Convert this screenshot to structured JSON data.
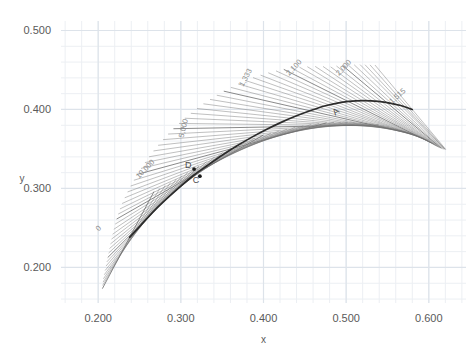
{
  "chart_data": {
    "type": "line",
    "title": "",
    "xlabel": "x",
    "ylabel": "y",
    "xlim": [
      0.155,
      0.645
    ],
    "ylim": [
      0.155,
      0.512
    ],
    "xticks": [
      "0.200",
      "0.300",
      "0.400",
      "0.500",
      "0.600"
    ],
    "xtick_values": [
      0.2,
      0.3,
      0.4,
      0.5,
      0.6
    ],
    "yticks": [
      "0.200",
      "0.300",
      "0.400",
      "0.500"
    ],
    "ytick_values": [
      0.2,
      0.3,
      0.4,
      0.5
    ],
    "grid": true,
    "grid_minor": true,
    "legend": "none",
    "series": [
      {
        "name": "trajectory",
        "type": "line",
        "color": "#2b2b2b",
        "x": [
          0.238,
          0.252,
          0.268,
          0.284,
          0.3,
          0.316,
          0.332,
          0.35,
          0.368,
          0.386,
          0.404,
          0.422,
          0.44,
          0.458,
          0.476,
          0.494,
          0.512,
          0.53,
          0.548,
          0.566,
          0.58
        ],
        "y": [
          0.238,
          0.254,
          0.272,
          0.288,
          0.303,
          0.317,
          0.329,
          0.342,
          0.354,
          0.365,
          0.375,
          0.384,
          0.392,
          0.399,
          0.405,
          0.409,
          0.411,
          0.411,
          0.409,
          0.405,
          0.4
        ]
      },
      {
        "name": "direction-field",
        "type": "segments",
        "color": "#6e6e6e",
        "description": "family of straight tangent lines crossing the trajectory"
      }
    ],
    "points": [
      {
        "label": "D",
        "x": 0.316,
        "y": 0.3245
      },
      {
        "label": "C",
        "x": 0.323,
        "y": 0.3155
      },
      {
        "label": "A",
        "x": 0.4905,
        "y": 0.4035
      }
    ],
    "contour_labels": [
      {
        "text": "0",
        "x": 0.2025,
        "y": 0.2475,
        "rotation": -46
      },
      {
        "text": "10,000",
        "x": 0.259,
        "y": 0.3225,
        "rotation": -46
      },
      {
        "text": "5,000",
        "x": 0.306,
        "y": 0.3755,
        "rotation": -76
      },
      {
        "text": "1,333",
        "x": 0.381,
        "y": 0.439,
        "rotation": -62
      },
      {
        "text": "2,100",
        "x": 0.439,
        "y": 0.451,
        "rotation": -47
      },
      {
        "text": "2,000",
        "x": 0.499,
        "y": 0.451,
        "rotation": -47
      },
      {
        "text": "1,515",
        "x": 0.564,
        "y": 0.415,
        "rotation": -42
      }
    ]
  },
  "axes": {
    "x_title": "x",
    "y_title": "y"
  }
}
